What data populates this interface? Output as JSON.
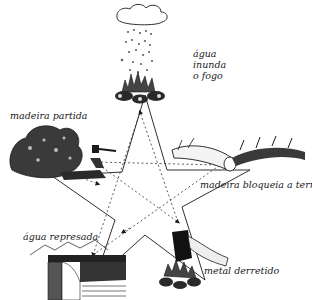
{
  "diagram": {
    "type": "five-element pentagram cycle",
    "nodes": [
      {
        "id": "top",
        "label_lines": [
          "água",
          "inunda",
          "o fogo"
        ],
        "illustration": "rain-cloud-over-fire"
      },
      {
        "id": "left",
        "label": "madeira partida",
        "illustration": "bush-with-axe"
      },
      {
        "id": "right",
        "label": "madeira bloqueia a terra",
        "illustration": "fallen-log-on-earth"
      },
      {
        "id": "bottom-left",
        "label": "água represada",
        "illustration": "dam-holding-water"
      },
      {
        "id": "bottom-right",
        "label": "metal derretido",
        "illustration": "metal-block-over-fire"
      }
    ],
    "edges": {
      "outer": {
        "style": "solid",
        "shape": "star-outline"
      },
      "inner": {
        "style": "dashed",
        "arrows": true,
        "shape": "pentagram"
      }
    },
    "colors": {
      "ink": "#1a1a1a",
      "background": "#ffffff"
    }
  }
}
